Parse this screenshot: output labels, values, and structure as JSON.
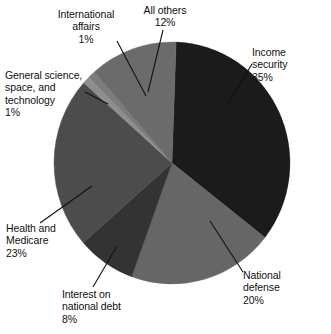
{
  "chart_data": {
    "type": "pie",
    "title": "",
    "unit": "%",
    "center": {
      "x": 172,
      "y": 163
    },
    "radius": {
      "rx": 118,
      "ry": 121
    },
    "start_angle_deg": -88,
    "direction": "clockwise",
    "legend": "none",
    "slices": [
      {
        "label": "Income security",
        "value": 35,
        "value_text": "35%",
        "color": "#1b1b1b"
      },
      {
        "label": "National defense",
        "value": 20,
        "value_text": "20%",
        "color": "#666666"
      },
      {
        "label": "Interest on national debt",
        "value": 8,
        "value_text": "8%",
        "color": "#333333"
      },
      {
        "label": "Health and Medicare",
        "value": 23,
        "value_text": "23%",
        "color": "#4c4c4c"
      },
      {
        "label": "General science, space, and technology",
        "value": 1,
        "value_text": "1%",
        "color": "#8e8e8e"
      },
      {
        "label": "International affairs",
        "value": 1,
        "value_text": "1%",
        "color": "#7c7c7c"
      },
      {
        "label": "All others",
        "value": 12,
        "value_text": "12%",
        "color": "#6b6b6b"
      }
    ]
  },
  "labels": {
    "international_affairs": "International\naffairs\n1%",
    "all_others": "All others\n12%",
    "general_science": "General science,\nspace, and\ntechnology\n1%",
    "income_security": "Income\nsecurity\n35%",
    "health_medicare": "Health and\nMedicare\n23%",
    "interest_debt": "Interest on\nnational debt\n8%",
    "national_defense": "National\ndefense\n20%"
  },
  "colors": {
    "background": "#ffffff",
    "text": "#111111",
    "leader_line": "#111111"
  }
}
